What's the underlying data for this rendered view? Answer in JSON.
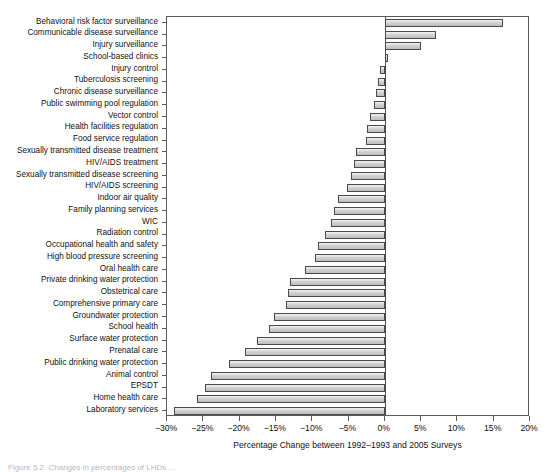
{
  "chart_data": {
    "type": "bar",
    "orientation": "horizontal",
    "title": "",
    "xlabel": "Percentage Change between 1992–1993 and 2005 Surveys",
    "ylabel": "",
    "xlim": [
      -30,
      20
    ],
    "xticks": [
      -30,
      -25,
      -20,
      -15,
      -10,
      -5,
      0,
      5,
      10,
      15,
      20
    ],
    "xticklabels": [
      "−30%",
      "−25%",
      "−20%",
      "−15%",
      "−10%",
      "−5%",
      "0%",
      "5%",
      "10%",
      "15%",
      "20%"
    ],
    "grid": false,
    "legend": null,
    "categories": [
      "Behavioral risk factor surveillance",
      "Communicable disease surveillance",
      "Injury surveillance",
      "School-based clinics",
      "Injury control",
      "Tuberculosis screening",
      "Chronic disease surveillance",
      "Public swimming pool regulation",
      "Vector control",
      "Health facilities regulation",
      "Food service regulation",
      "Sexually transmitted disease treatment",
      "HIV/AIDS treatment",
      "Sexually transmitted disease screening",
      "HIV/AIDS screening",
      "Indoor air quality",
      "Family planning services",
      "WIC",
      "Radiation control",
      "Occupational health and safety",
      "High blood pressure screening",
      "Oral health care",
      "Private drinking water protection",
      "Obstetrical care",
      "Comprehensive primary care",
      "Groundwater protection",
      "School health",
      "Surface water protection",
      "Prenatal care",
      "Public drinking water protection",
      "Animal control",
      "EPSDT",
      "Home health care",
      "Laboratory services"
    ],
    "values": [
      16.3,
      7.0,
      5.0,
      0.5,
      -0.6,
      -1.0,
      -1.2,
      -1.5,
      -2.0,
      -2.4,
      -2.6,
      -4.0,
      -4.2,
      -4.6,
      -5.2,
      -6.4,
      -7.0,
      -7.4,
      -8.3,
      -9.2,
      -9.6,
      -11.0,
      -13.0,
      -13.4,
      -13.6,
      -15.2,
      -16.0,
      -17.6,
      -19.2,
      -21.4,
      -24.0,
      -24.8,
      -25.8,
      -29.0
    ]
  },
  "figure": {
    "caption_fragment": "Figure 5.2. Changes in percentages of LHDs ..."
  }
}
